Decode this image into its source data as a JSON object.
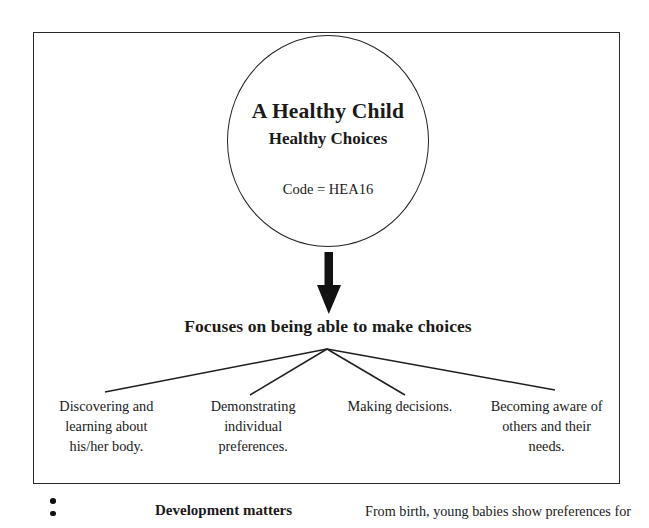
{
  "document": {
    "frame_label": "A Healthy Child diagram frame"
  },
  "circle": {
    "title": "A Healthy Child",
    "subtitle": "Healthy Choices",
    "code": "Code = HEA16"
  },
  "arrow": {
    "icon": "down-arrow-icon"
  },
  "focus": {
    "heading": "Focuses on being able to make choices"
  },
  "leaves": [
    {
      "text": "Discovering and\nlearning about\nhis/her body."
    },
    {
      "text": "Demonstrating individual\npreferences."
    },
    {
      "text": "Making decisions."
    },
    {
      "text": "Becoming aware of\nothers and their\nneeds."
    }
  ],
  "bottom_row": {
    "bullets": 2,
    "label": "Development matters",
    "text": "From birth, young babies show preferences for"
  },
  "colors": {
    "page_background": "#ffffff",
    "ink": "#1a1a1a",
    "frame_stroke": "#2b2b2b",
    "circle_stroke": "#232323",
    "line_stroke": "#1f1f1f"
  }
}
